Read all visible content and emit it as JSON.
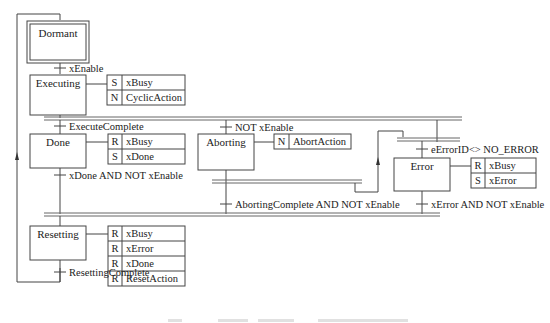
{
  "diagram": {
    "type": "sequential-function-chart",
    "steps": [
      {
        "id": "dormant",
        "name": "Dormant",
        "initial": true,
        "actions": []
      },
      {
        "id": "executing",
        "name": "Executing",
        "actions": [
          {
            "qualifier": "S",
            "name": "xBusy"
          },
          {
            "qualifier": "N",
            "name": "CyclicAction"
          }
        ]
      },
      {
        "id": "done",
        "name": "Done",
        "actions": [
          {
            "qualifier": "R",
            "name": "xBusy"
          },
          {
            "qualifier": "S",
            "name": "xDone"
          }
        ]
      },
      {
        "id": "aborting",
        "name": "Aborting",
        "actions": [
          {
            "qualifier": "N",
            "name": "AbortAction"
          }
        ]
      },
      {
        "id": "error",
        "name": "Error",
        "actions": [
          {
            "qualifier": "R",
            "name": "xBusy"
          },
          {
            "qualifier": "S",
            "name": "xError"
          }
        ]
      },
      {
        "id": "resetting",
        "name": "Resetting",
        "actions": [
          {
            "qualifier": "R",
            "name": "xBusy"
          },
          {
            "qualifier": "R",
            "name": "xError"
          },
          {
            "qualifier": "R",
            "name": "xDone"
          },
          {
            "qualifier": "R",
            "name": "ResetAction"
          }
        ]
      }
    ],
    "transitions": [
      {
        "id": "t_enable",
        "label": "xEnable"
      },
      {
        "id": "t_exec_complete",
        "label": "ExecuteComplete"
      },
      {
        "id": "t_not_enable",
        "label": "NOT xEnable"
      },
      {
        "id": "t_error",
        "label": "eErrorID<> NO_ERROR"
      },
      {
        "id": "t_done_reset",
        "label": "xDone AND NOT xEnable"
      },
      {
        "id": "t_abort_reset",
        "label": "AbortingComplete AND NOT xEnable"
      },
      {
        "id": "t_error_reset",
        "label": "xError AND NOT xEnable"
      },
      {
        "id": "t_reset_complete",
        "label": "ResettingComplete"
      }
    ]
  },
  "caption": {
    "visible": "truncated",
    "text": ""
  }
}
